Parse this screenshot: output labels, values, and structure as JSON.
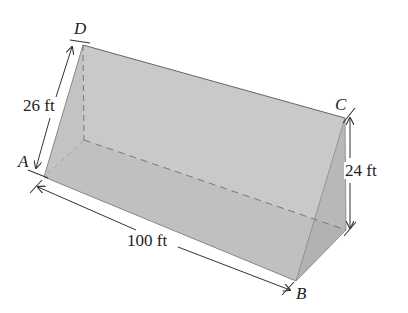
{
  "figure": {
    "type": "triangular prism (ramp)",
    "vertices": {
      "A": "A",
      "B": "B",
      "C": "C",
      "D": "D"
    },
    "dimensions": {
      "slant_edge_AD": "26 ft",
      "height_C": "24 ft",
      "length_AB": "100 ft"
    },
    "colors": {
      "face_top": "#c9c9c9",
      "face_bottom": "#a8a8a8",
      "face_end": "#b9b9b9",
      "edge": "#555555",
      "hidden_edge": "#777777"
    }
  }
}
